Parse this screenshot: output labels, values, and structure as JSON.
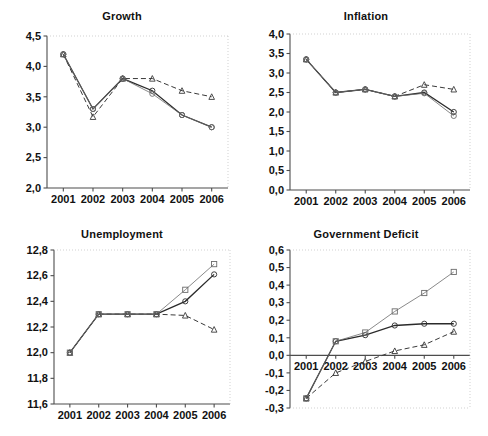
{
  "figure": {
    "width": 488,
    "height": 436,
    "background": "#ffffff",
    "panel_count": 4
  },
  "colors": {
    "axis": "#4d4d4d",
    "text": "#111111",
    "series_solid_circle": "#2b2b2b",
    "series_dashed_triangle": "#3a3a3a",
    "series_thin_square": "#6b6b6b",
    "gridline": "#bdbdbd"
  },
  "panels": [
    {
      "id": "growth",
      "title": "Growth"
    },
    {
      "id": "inflation",
      "title": "Inflation"
    },
    {
      "id": "unemployment",
      "title": "Unemployment"
    },
    {
      "id": "government-deficit",
      "title": "Government Deficit"
    }
  ],
  "chart_data": [
    {
      "type": "line",
      "title": "Growth",
      "xlabel": "",
      "ylabel": "",
      "x": [
        "2001",
        "2002",
        "2003",
        "2004",
        "2005",
        "2006"
      ],
      "categories": [
        "2001",
        "2002",
        "2003",
        "2004",
        "2005",
        "2006"
      ],
      "xtick_labels": [
        "2001",
        "2002",
        "2003",
        "2004",
        "2005",
        "2006"
      ],
      "ytick_labels": [
        "2,0",
        "2,5",
        "3,0",
        "3,5",
        "4,0",
        "4,5"
      ],
      "yticks": [
        2.0,
        2.5,
        3.0,
        3.5,
        4.0,
        4.5
      ],
      "ylim": [
        2.0,
        4.5
      ],
      "grid": false,
      "legend": "none",
      "series": [
        {
          "name": "solid-circle",
          "marker": "circle",
          "linestyle": "solid",
          "values": [
            4.2,
            3.3,
            3.8,
            3.6,
            3.2,
            3.0
          ]
        },
        {
          "name": "dashed-triangle",
          "marker": "triangle",
          "linestyle": "dashed",
          "values": [
            4.2,
            3.17,
            3.8,
            3.8,
            3.6,
            3.5
          ]
        },
        {
          "name": "thin-line",
          "marker": "circle",
          "linestyle": "solid-thin",
          "values": [
            4.2,
            3.3,
            3.8,
            3.55,
            3.2,
            3.0
          ]
        }
      ]
    },
    {
      "type": "line",
      "title": "Inflation",
      "xlabel": "",
      "ylabel": "",
      "x": [
        "2001",
        "2002",
        "2003",
        "2004",
        "2005",
        "2006"
      ],
      "categories": [
        "2001",
        "2002",
        "2003",
        "2004",
        "2005",
        "2006"
      ],
      "xtick_labels": [
        "2001",
        "2002",
        "2003",
        "2004",
        "2005",
        "2006"
      ],
      "ytick_labels": [
        "0,0",
        "0,5",
        "1,0",
        "1,5",
        "2,0",
        "2,5",
        "3,0",
        "3,5",
        "4,0"
      ],
      "yticks": [
        0.0,
        0.5,
        1.0,
        1.5,
        2.0,
        2.5,
        3.0,
        3.5,
        4.0
      ],
      "ylim": [
        0.0,
        4.0
      ],
      "grid": false,
      "legend": "none",
      "series": [
        {
          "name": "solid-circle",
          "marker": "circle",
          "linestyle": "solid",
          "values": [
            3.35,
            2.5,
            2.58,
            2.4,
            2.5,
            2.0
          ]
        },
        {
          "name": "dashed-triangle",
          "marker": "triangle",
          "linestyle": "dashed",
          "values": [
            3.35,
            2.5,
            2.58,
            2.4,
            2.7,
            2.58
          ]
        },
        {
          "name": "thin-line",
          "marker": "circle",
          "linestyle": "solid-thin",
          "values": [
            3.35,
            2.5,
            2.58,
            2.4,
            2.48,
            1.9
          ]
        }
      ]
    },
    {
      "type": "line",
      "title": "Unemployment",
      "xlabel": "",
      "ylabel": "",
      "x": [
        "2001",
        "2002",
        "2003",
        "2004",
        "2005",
        "2006"
      ],
      "categories": [
        "2001",
        "2002",
        "2003",
        "2004",
        "2005",
        "2006"
      ],
      "xtick_labels": [
        "2001",
        "2002",
        "2003",
        "2004",
        "2005",
        "2006"
      ],
      "ytick_labels": [
        "11,6",
        "11,8",
        "12,0",
        "12,2",
        "12,4",
        "12,6",
        "12,8"
      ],
      "yticks": [
        11.6,
        11.8,
        12.0,
        12.2,
        12.4,
        12.6,
        12.8
      ],
      "ylim": [
        11.6,
        12.8
      ],
      "grid": false,
      "legend": "none",
      "series": [
        {
          "name": "solid-circle",
          "marker": "circle",
          "linestyle": "solid",
          "values": [
            12.0,
            12.3,
            12.3,
            12.3,
            12.4,
            12.61
          ]
        },
        {
          "name": "dashed-triangle",
          "marker": "triangle",
          "linestyle": "dashed",
          "values": [
            12.0,
            12.3,
            12.3,
            12.3,
            12.29,
            12.18
          ]
        },
        {
          "name": "thin-square",
          "marker": "square",
          "linestyle": "solid-thin",
          "values": [
            12.0,
            12.3,
            12.3,
            12.3,
            12.49,
            12.69
          ]
        }
      ]
    },
    {
      "type": "line",
      "title": "Government Deficit",
      "xlabel": "",
      "ylabel": "",
      "x": [
        "2001",
        "2002",
        "2003",
        "2004",
        "2005",
        "2006"
      ],
      "categories": [
        "2001",
        "2002",
        "2003",
        "2004",
        "2005",
        "2006"
      ],
      "xtick_labels": [
        "2001",
        "2002",
        "2003",
        "2004",
        "2005",
        "2006"
      ],
      "ytick_labels": [
        "-0,3",
        "-0,2",
        "-0,1",
        "0,0",
        "0,1",
        "0,2",
        "0,3",
        "0,4",
        "0,5",
        "0,6"
      ],
      "yticks": [
        -0.3,
        -0.2,
        -0.1,
        0.0,
        0.1,
        0.2,
        0.3,
        0.4,
        0.5,
        0.6
      ],
      "ylim": [
        -0.3,
        0.6
      ],
      "grid": false,
      "legend": "none",
      "zero_line": 0.0,
      "series": [
        {
          "name": "solid-circle",
          "marker": "circle",
          "linestyle": "solid",
          "values": [
            -0.245,
            0.08,
            0.115,
            0.17,
            0.18,
            0.18
          ]
        },
        {
          "name": "dashed-triangle",
          "marker": "triangle",
          "linestyle": "dashed",
          "values": [
            -0.245,
            -0.1,
            -0.035,
            0.025,
            0.06,
            0.135
          ]
        },
        {
          "name": "thin-square",
          "marker": "square",
          "linestyle": "solid-thin",
          "values": [
            -0.245,
            0.08,
            0.13,
            0.25,
            0.355,
            0.475
          ]
        }
      ]
    }
  ]
}
